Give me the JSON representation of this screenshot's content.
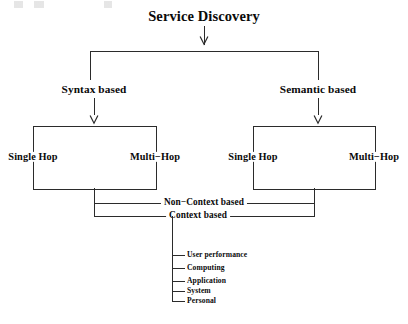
{
  "figure": {
    "title": "Service Discovery",
    "background_color": "#ffffff",
    "line_color": "#2b2b2b",
    "text_color": "#0a0a0a"
  },
  "branches": {
    "left": {
      "label": "Syntax based",
      "box": {
        "edge_left_label": "Single Hop",
        "edge_right_label": "Multi−Hop"
      }
    },
    "right": {
      "label": "Semantic based",
      "box": {
        "edge_left_label": "Single Hop",
        "edge_right_label": "Multi−Hop"
      }
    }
  },
  "connectors": {
    "non_context": "Non−Context based",
    "context": "Context based"
  },
  "context_children": [
    {
      "label": "User performance"
    },
    {
      "label": "Computing"
    },
    {
      "label": "Application"
    },
    {
      "label": "System"
    },
    {
      "label": "Personal"
    }
  ]
}
